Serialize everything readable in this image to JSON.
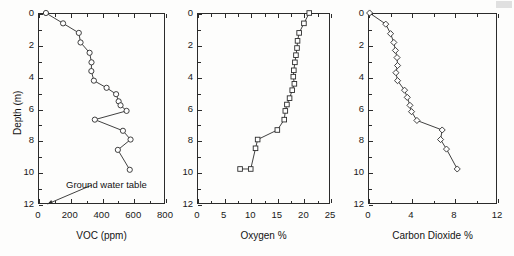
{
  "figure": {
    "title": "",
    "background_color": "#fdfdfc",
    "axis_color": "#2b2b2b",
    "marker_color": "#2b2b2b",
    "line_color": "#2b2b2b"
  },
  "annotations": {
    "ground_water_table_label": "Ground water table"
  },
  "chart_data": [
    {
      "type": "line",
      "panel": "voc",
      "title": "",
      "xlabel": "VOC (ppm)",
      "ylabel": "Depth (m)",
      "xlim": [
        0,
        800
      ],
      "ylim": [
        12,
        0
      ],
      "y_inverted": true,
      "grid": false,
      "legend": "none",
      "marker": "circle",
      "xticks": [
        0,
        200,
        400,
        600,
        800
      ],
      "xticklabels": [
        "0",
        "200",
        "400",
        "600",
        "800"
      ],
      "x_minor_ticks": [
        100,
        300,
        500,
        700
      ],
      "yticks": [
        0,
        2,
        4,
        6,
        8,
        10,
        12
      ],
      "yticklabels": [
        "0",
        "2",
        "4",
        "6",
        "8",
        "10",
        "12"
      ],
      "y_minor_ticks": [
        1,
        3,
        5,
        7,
        9,
        11
      ],
      "series": [
        {
          "name": "VOC",
          "x": [
            50,
            158,
            257,
            268,
            325,
            337,
            336,
            352,
            432,
            492,
            508,
            520,
            558,
            358,
            535,
            583,
            503,
            578
          ],
          "y": [
            0.0,
            0.65,
            1.25,
            1.85,
            2.5,
            3.1,
            3.65,
            4.25,
            4.7,
            5.1,
            5.55,
            5.8,
            6.15,
            6.7,
            7.4,
            7.95,
            8.6,
            9.85
          ]
        }
      ],
      "annotation": {
        "text": "Ground water table",
        "arrow_tip_x": 60,
        "arrow_tip_y": 12.0
      }
    },
    {
      "type": "line",
      "panel": "oxygen",
      "title": "",
      "xlabel": "Oxygen %",
      "ylabel": "",
      "xlim": [
        0,
        25
      ],
      "ylim": [
        12,
        0
      ],
      "y_inverted": true,
      "grid": false,
      "legend": "none",
      "marker": "square",
      "xticks": [
        0,
        5,
        10,
        15,
        20,
        25
      ],
      "xticklabels": [
        "0",
        "5",
        "10",
        "15",
        "20",
        "25"
      ],
      "x_minor_ticks": [
        2.5,
        7.5,
        12.5,
        17.5,
        22.5
      ],
      "yticks": [
        0,
        2,
        4,
        6,
        8,
        10,
        12
      ],
      "yticklabels": [
        "0",
        "2",
        "4",
        "6",
        "8",
        "10",
        "12"
      ],
      "y_minor_ticks": [
        1,
        3,
        5,
        7,
        9,
        11
      ],
      "series": [
        {
          "name": "Oxygen",
          "x": [
            21.1,
            20.1,
            19.2,
            18.9,
            18.8,
            18.6,
            18.4,
            18.2,
            18.1,
            18.3,
            17.9,
            17.4,
            16.9,
            16.6,
            16.4,
            15.1,
            11.4,
            11.0,
            10.1,
            8.1
          ],
          "y": [
            0.0,
            0.65,
            1.25,
            1.75,
            2.2,
            2.65,
            3.1,
            3.6,
            4.0,
            4.45,
            4.85,
            5.35,
            5.75,
            6.15,
            6.7,
            7.35,
            7.95,
            8.5,
            9.8,
            9.8
          ]
        }
      ]
    },
    {
      "type": "line",
      "panel": "carbon_dioxide",
      "title": "",
      "xlabel": "Carbon Dioxide %",
      "ylabel": "",
      "xlim": [
        0,
        12
      ],
      "ylim": [
        12,
        0
      ],
      "y_inverted": true,
      "grid": false,
      "legend": "none",
      "marker": "diamond",
      "xticks": [
        0,
        4,
        8,
        12
      ],
      "xticklabels": [
        "0",
        "4",
        "8",
        "12"
      ],
      "x_minor_ticks": [
        2,
        6,
        10
      ],
      "yticks": [
        0,
        2,
        4,
        6,
        8,
        10,
        12
      ],
      "yticklabels": [
        "0",
        "2",
        "4",
        "6",
        "8",
        "10",
        "12"
      ],
      "y_minor_ticks": [
        1,
        3,
        5,
        7,
        9,
        11
      ],
      "series": [
        {
          "name": "Carbon Dioxide",
          "x": [
            0.15,
            1.65,
            2.1,
            2.4,
            2.55,
            2.7,
            2.75,
            2.6,
            2.75,
            3.4,
            3.65,
            3.9,
            4.05,
            4.55,
            6.9,
            6.75,
            7.3,
            8.3
          ],
          "y": [
            0.0,
            0.7,
            1.3,
            1.85,
            2.35,
            2.8,
            3.3,
            3.75,
            4.25,
            4.85,
            5.3,
            5.8,
            6.2,
            6.75,
            7.35,
            7.95,
            8.55,
            9.8
          ]
        }
      ]
    }
  ]
}
